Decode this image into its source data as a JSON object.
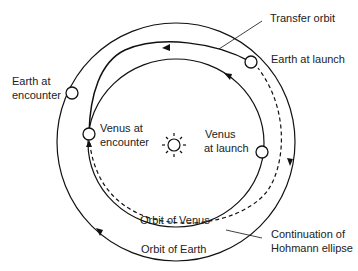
{
  "labels": {
    "transfer_orbit": "Transfer orbit",
    "earth_at_launch": "Earth at launch",
    "earth_at_encounter_1": "Earth at",
    "earth_at_encounter_2": "encounter",
    "venus_at_encounter_1": "Venus at",
    "venus_at_encounter_2": "encounter",
    "venus_at_launch_1": "Venus",
    "venus_at_launch_2": "at launch",
    "orbit_of_venus": "Orbit of Venus",
    "orbit_of_earth": "Orbit of Earth",
    "continuation_1": "Continuation of",
    "continuation_2": "Hohmann ellipse"
  },
  "colors": {
    "line": "#111111",
    "background": "#ffffff"
  }
}
